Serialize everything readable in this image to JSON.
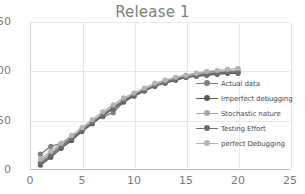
{
  "chart_data": {
    "type": "line",
    "title": "Release 1",
    "xlabel": "",
    "ylabel": "",
    "xlim": [
      0,
      25
    ],
    "ylim": [
      0,
      150
    ],
    "xticks": [
      0,
      5,
      10,
      15,
      20,
      25
    ],
    "yticks": [
      0,
      50,
      100,
      150
    ],
    "grid": true,
    "legend_position": "inside-right",
    "x": [
      1,
      2,
      3,
      4,
      5,
      6,
      7,
      8,
      9,
      10,
      11,
      12,
      13,
      14,
      15,
      16,
      17,
      18,
      19,
      20
    ],
    "series": [
      {
        "name": "Actual data",
        "color": "#808080",
        "marker": "circle",
        "values": [
          16,
          24,
          27,
          33,
          41,
          49,
          54,
          58,
          69,
          75,
          81,
          86,
          90,
          93,
          96,
          98,
          99,
          100,
          100,
          100
        ]
      },
      {
        "name": "Imperfect debugging",
        "color": "#5a5a5a",
        "marker": "circle",
        "values": [
          5,
          13,
          22,
          30,
          39,
          47,
          55,
          62,
          69,
          75,
          80,
          85,
          88,
          91,
          94,
          95,
          96,
          97,
          98,
          98
        ]
      },
      {
        "name": "Stochastic nature",
        "color": "#a6a6a6",
        "marker": "circle",
        "values": [
          9,
          17,
          25,
          33,
          41,
          49,
          57,
          64,
          71,
          77,
          82,
          86,
          90,
          93,
          95,
          97,
          98,
          99,
          100,
          101
        ]
      },
      {
        "name": "Testing Effort",
        "color": "#6e6e6e",
        "marker": "circle",
        "values": [
          7,
          15,
          24,
          32,
          40,
          48,
          56,
          63,
          70,
          76,
          81,
          85,
          89,
          92,
          94,
          96,
          97,
          98,
          99,
          99
        ]
      },
      {
        "name": "perfect Debugging",
        "color": "#b3b3b3",
        "marker": "circle",
        "values": [
          11,
          19,
          27,
          35,
          43,
          51,
          59,
          66,
          73,
          78,
          83,
          88,
          91,
          94,
          96,
          98,
          100,
          101,
          102,
          103
        ]
      }
    ]
  },
  "colors": {
    "title": "#7f7f7f",
    "grid": "#e8e8e8",
    "axis": "#bfbfbf",
    "tick_text": "#7a7a7a",
    "legend_text": "#4a4a4a",
    "background": "#ffffff"
  }
}
